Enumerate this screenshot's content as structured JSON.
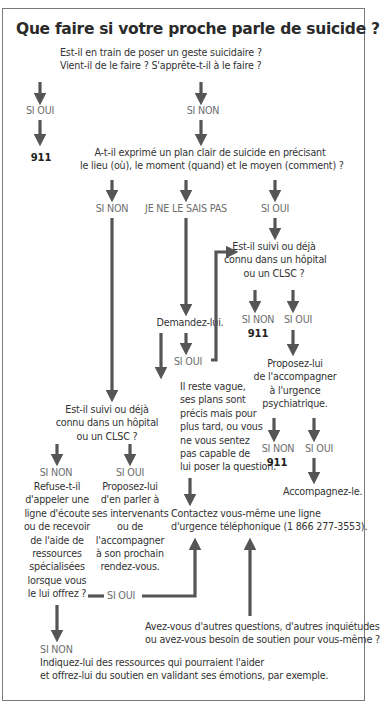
{
  "title": "Que faire si votre proche parle de suicide ?",
  "nodes": {
    "q1_line1": "Est-il en train de poser un geste suicidaire ?",
    "q1_line2": "Vient-il de le faire ? S'apprête-t-il à le faire ?",
    "q1_yes": "SI OUI",
    "q1_no": "SI NON",
    "emergency_1": "911",
    "q2_line1": "A-t-il exprimé un plan clair de suicide en précisant",
    "q2_line2": "le lieu (où), le moment (quand) et le moyen (comment) ?",
    "q2_no": "SI NON",
    "q2_unknown": "JE NE LE SAIS PAS",
    "q2_yes": "SI OUI",
    "q3a_line1": "Est-il suivi ou déjà",
    "q3a_line2": "connu dans un hôpital",
    "q3a_line3": "ou un CLSC ?",
    "q3a_no": "SI NON",
    "q3a_yes": "SI OUI",
    "emergency_2": "911",
    "ask_him": "Demandez-lui.",
    "ask_yes": "SI OUI",
    "vague_lines": [
      "Il reste vague,",
      "ses plans sont",
      "précis mais pour",
      "plus tard, ou vous",
      "ne vous sentez",
      "pas capable de",
      "lui poser la question."
    ],
    "propose_er_lines": [
      "Proposez-lui",
      "de l'accompagner",
      "à l'urgence",
      "psychiatrique."
    ],
    "er_no": "SI NON",
    "er_yes": "SI OUI",
    "emergency_3": "911",
    "accompany": "Accompagnez-le.",
    "q3b_line1": "Est-il suivi ou déjà",
    "q3b_line2": "connu dans un hôpital",
    "q3b_line3": "ou un CLSC ?",
    "q3b_no": "SI NON",
    "q3b_yes": "SI OUI",
    "refuse_lines": [
      "Refuse-t-il",
      "d'appeler une",
      "ligne d'écoute",
      "ou de recevoir",
      "de l'aide de",
      "ressources",
      "spécialisées",
      "lorsque vous",
      "le lui offrez ?"
    ],
    "refuse_yes": "SI OUI",
    "talk_lines": [
      "Proposez-lui",
      "d'en parler à",
      "ses intervenants",
      "ou de",
      "l'accompagner",
      "à son prochain",
      "rendez-vous."
    ],
    "hotline_line1": "Contactez vous-même une ligne",
    "hotline_line2": "d'urgence téléphonique (1 866 277-3553).",
    "other_q_line1": "Avez-vous d'autres questions, d'autres inquiétudes",
    "other_q_line2": "ou avez-vous besoin de soutien pour vous-même ?",
    "refuse_no": "SI NON",
    "resources_line1": "Indiquez-lui des ressources qui pourraient l'aider",
    "resources_line2": "et offrez-lui du soutien en validant ses émotions, par exemple."
  },
  "colors": {
    "arrow": "#555555",
    "border": "#7a7a7a",
    "label": "#6e6e6e",
    "text": "#333333"
  }
}
